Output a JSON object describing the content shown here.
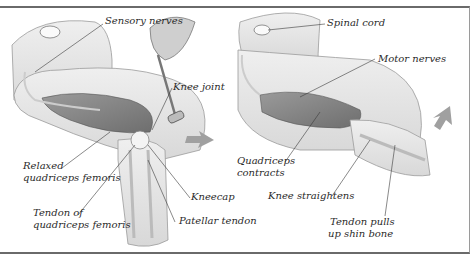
{
  "figure": {
    "panels": [
      {
        "name": "stimulus",
        "labels": [
          {
            "id": "sensory_nerves",
            "text": "Sensory nerves"
          },
          {
            "id": "knee_joint",
            "text": "Knee joint"
          },
          {
            "id": "relaxed_1",
            "text": "Relaxed"
          },
          {
            "id": "relaxed_2",
            "text": "quadriceps femoris"
          },
          {
            "id": "tendon_of_1",
            "text": "Tendon of"
          },
          {
            "id": "tendon_of_2",
            "text": "quadriceps femoris"
          },
          {
            "id": "kneecap",
            "text": "Kneecap"
          },
          {
            "id": "patellar_tendon",
            "text": "Patellar tendon"
          }
        ]
      },
      {
        "name": "response",
        "labels": [
          {
            "id": "spinal_cord",
            "text": "Spinal cord"
          },
          {
            "id": "motor_nerves",
            "text": "Motor nerves"
          },
          {
            "id": "quad_contracts_1",
            "text": "Quadriceps"
          },
          {
            "id": "quad_contracts_2",
            "text": "contracts"
          },
          {
            "id": "knee_straightens",
            "text": "Knee straightens"
          },
          {
            "id": "tendon_pulls_1",
            "text": "Tendon pulls"
          },
          {
            "id": "tendon_pulls_2",
            "text": "up shin bone"
          }
        ]
      }
    ],
    "colors": {
      "skin": "#e4e4e4",
      "muscle": "#8a8a8a",
      "arrow": "#9a9a9a",
      "leader": "#3a3a3a",
      "border": "#6a6a6a"
    }
  }
}
